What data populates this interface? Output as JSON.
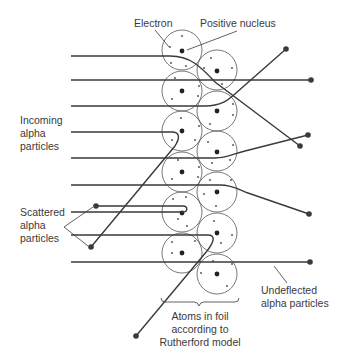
{
  "labels": {
    "electron": "Electron",
    "nucleus": "Positive nucleus",
    "incoming": [
      "Incoming",
      "alpha",
      "particles"
    ],
    "scattered": [
      "Scattered",
      "alpha",
      "particles"
    ],
    "undeflected": [
      "Undeflected",
      "alpha particles"
    ],
    "atoms": [
      "Atoms in foil",
      "according to",
      "Rutherford model"
    ]
  },
  "colors": {
    "line": "#3a3a3a",
    "atom_outline": "#555555",
    "nucleus": "#222222",
    "electron": "#666666",
    "background": "#ffffff"
  },
  "atoms": {
    "radius": 20,
    "left_column": {
      "x": 182,
      "y": [
        50,
        91,
        131,
        172,
        212,
        253
      ]
    },
    "right_column": {
      "x": 217,
      "y": [
        70,
        111,
        151,
        192,
        233,
        274
      ]
    }
  },
  "trajectories": [
    {
      "type": "deflected",
      "start_y": 56,
      "end": [
        300,
        146
      ]
    },
    {
      "type": "undeflected",
      "start_y": 80,
      "end": [
        311,
        79
      ]
    },
    {
      "type": "deflected",
      "start_y": 106,
      "end": [
        286,
        49
      ]
    },
    {
      "type": "scattered",
      "start_y": 132,
      "end": [
        91,
        247
      ]
    },
    {
      "type": "deflected",
      "start_y": 158,
      "end": [
        308,
        135
      ]
    },
    {
      "type": "deflected",
      "start_y": 185,
      "end": [
        309,
        214
      ]
    },
    {
      "type": "scattered",
      "start_y": 212,
      "end": [
        96,
        206
      ]
    },
    {
      "type": "scattered",
      "start_y": 235,
      "end": [
        136,
        336
      ]
    },
    {
      "type": "undeflected",
      "start_y": 262,
      "end": [
        310,
        262
      ]
    }
  ]
}
